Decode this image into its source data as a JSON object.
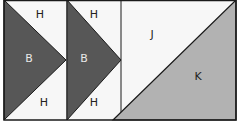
{
  "colors": {
    "background": "#f7f7f7",
    "dark_triangle": "#575757",
    "light_triangle": "#b2b2b2",
    "stroke": "#1a1a1a",
    "label_on_dark": "#e8e8e8",
    "label_on_light": "#222222"
  },
  "blocks": [
    {
      "name": "flying-geese-1",
      "top_label": "H",
      "center_label": "B",
      "bottom_label": "H"
    },
    {
      "name": "flying-geese-2",
      "top_label": "H",
      "center_label": "B",
      "bottom_label": "H"
    },
    {
      "name": "half-square-triangle",
      "upper_label": "J",
      "lower_label": "K"
    }
  ]
}
